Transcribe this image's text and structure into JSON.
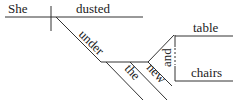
{
  "diagram": {
    "type": "sentence-diagram",
    "subject": "She",
    "verb": "dusted",
    "preposition": "under",
    "article": "the",
    "adjective": "new",
    "conjunction": "and",
    "objects": [
      "table",
      "chairs"
    ],
    "colors": {
      "line": "#333333",
      "text": "#222222",
      "background": "#ffffff"
    }
  }
}
